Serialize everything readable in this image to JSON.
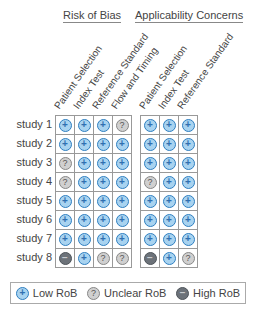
{
  "chart_data": {
    "type": "table",
    "title": "",
    "groups": [
      {
        "name": "Risk of Bias",
        "columns": [
          "Patient Selection",
          "Index Test",
          "Reference Standard",
          "Flow and Timing"
        ]
      },
      {
        "name": "Applicability Concerns",
        "columns": [
          "Patient Selection",
          "Index Test",
          "Reference Standard"
        ]
      }
    ],
    "rows": [
      "study 1",
      "study 2",
      "study 3",
      "study 4",
      "study 5",
      "study 6",
      "study 7",
      "study 8"
    ],
    "risk_of_bias": [
      [
        "low",
        "low",
        "low",
        "unclear"
      ],
      [
        "low",
        "low",
        "low",
        "low"
      ],
      [
        "unclear",
        "low",
        "low",
        "low"
      ],
      [
        "unclear",
        "low",
        "low",
        "low"
      ],
      [
        "low",
        "low",
        "low",
        "low"
      ],
      [
        "low",
        "low",
        "low",
        "low"
      ],
      [
        "low",
        "low",
        "low",
        "low"
      ],
      [
        "high",
        "low",
        "unclear",
        "unclear"
      ]
    ],
    "applicability_concerns": [
      [
        "low",
        "low",
        "low"
      ],
      [
        "low",
        "low",
        "low"
      ],
      [
        "low",
        "low",
        "low"
      ],
      [
        "unclear",
        "low",
        "low"
      ],
      [
        "low",
        "low",
        "low"
      ],
      [
        "low",
        "low",
        "low"
      ],
      [
        "low",
        "low",
        "low"
      ],
      [
        "high",
        "low",
        "unclear"
      ]
    ],
    "legend": [
      {
        "key": "low",
        "label": "Low RoB",
        "symbol": "+",
        "color": "#a8d3f0"
      },
      {
        "key": "unclear",
        "label": "Unclear RoB",
        "symbol": "?",
        "color": "#d0d0d0"
      },
      {
        "key": "high",
        "label": "High RoB",
        "symbol": "−",
        "color": "#6c7279"
      }
    ]
  }
}
